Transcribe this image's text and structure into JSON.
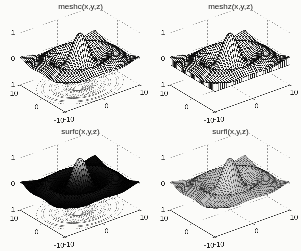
{
  "figure": {
    "background": "#fbfbf9"
  },
  "render_style": {
    "mesh_line": "#0f0f0f",
    "grid_line": "#8c8c8c",
    "axis_line": "#2a2a2a",
    "text_color": "#1c1c1c",
    "contour_line": "#4a4a4a",
    "surface_fill": "#fbfbf9",
    "light_direction": [
      -0.55,
      -0.4,
      0.72
    ]
  },
  "chart_data": [
    {
      "type": "surface3d",
      "variant": "meshc",
      "title": "meshc(x,y,z)",
      "z_function": "z = sin(R)/R, R = sqrt(x^2+y^2)",
      "x_range": [
        -10,
        10
      ],
      "y_range": [
        -10,
        10
      ],
      "z_range": [
        -1,
        1
      ],
      "x_ticks": [
        -10,
        0,
        10
      ],
      "y_ticks": [
        -10,
        0,
        10
      ],
      "z_ticks": [
        -1,
        0,
        1
      ],
      "grid": true,
      "grid_step": 0.5,
      "shading": "wireframe",
      "contour": true,
      "curtain": false,
      "contour_levels": [
        -0.2,
        -0.15,
        -0.1,
        -0.05,
        0.05,
        0.1,
        0.2,
        0.4,
        0.6,
        0.8
      ]
    },
    {
      "type": "surface3d",
      "variant": "meshz",
      "title": "meshz(x,y,z)",
      "z_function": "z = sin(R)/R, R = sqrt(x^2+y^2)",
      "x_range": [
        -10,
        10
      ],
      "y_range": [
        -10,
        10
      ],
      "z_range": [
        -1,
        1
      ],
      "x_ticks": [
        -10,
        0,
        10
      ],
      "y_ticks": [
        -10,
        0,
        10
      ],
      "z_ticks": [
        -1,
        0,
        1
      ],
      "grid": true,
      "grid_step": 0.5,
      "shading": "wireframe",
      "contour": false,
      "curtain": true,
      "contour_levels": []
    },
    {
      "type": "surface3d",
      "variant": "surfc",
      "title": "surfc(x,y,z)",
      "z_function": "z = sin(R)/R, R = sqrt(x^2+y^2)",
      "x_range": [
        -10,
        10
      ],
      "y_range": [
        -10,
        10
      ],
      "z_range": [
        -1,
        1
      ],
      "x_ticks": [
        -10,
        0,
        10
      ],
      "y_ticks": [
        -10,
        0,
        10
      ],
      "z_ticks": [
        -1,
        0,
        1
      ],
      "grid": true,
      "grid_step": 0.5,
      "shading": "height",
      "contour": true,
      "curtain": false,
      "contour_levels": [
        -0.2,
        -0.15,
        -0.1,
        -0.05,
        0.05,
        0.1,
        0.2,
        0.4,
        0.6,
        0.8
      ]
    },
    {
      "type": "surface3d",
      "variant": "surfl",
      "title": "surfl(x,y,z)",
      "z_function": "z = sin(R)/R, R = sqrt(x^2+y^2)",
      "x_range": [
        -10,
        10
      ],
      "y_range": [
        -10,
        10
      ],
      "z_range": [
        -1,
        1
      ],
      "x_ticks": [
        -10,
        0,
        10
      ],
      "y_ticks": [
        -10,
        0,
        10
      ],
      "z_ticks": [
        -1,
        0,
        1
      ],
      "grid": true,
      "grid_step": 0.5,
      "shading": "lit",
      "contour": false,
      "curtain": false,
      "contour_levels": []
    }
  ]
}
